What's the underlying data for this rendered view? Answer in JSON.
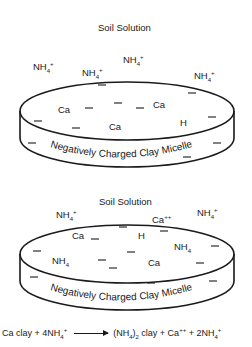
{
  "diagram1": {
    "title": "Soil Solution",
    "solution_ions": [
      {
        "ion": "NH",
        "sub": "4",
        "sup": "+"
      },
      {
        "ion": "NH",
        "sub": "4",
        "sup": "+"
      },
      {
        "ion": "NH",
        "sub": "4",
        "sup": "+"
      },
      {
        "ion": "NH",
        "sub": "4",
        "sup": "+"
      }
    ],
    "micelle_ions": [
      "Ca",
      "Ca",
      "Ca",
      "H"
    ],
    "micelle_label": "Negatively Charged Clay Micelle",
    "charge_symbol": "−"
  },
  "diagram2": {
    "title": "Soil Solution",
    "solution_ions": [
      {
        "ion": "NH",
        "sub": "4",
        "sup": "+"
      },
      {
        "ion": "Ca",
        "sub": "",
        "sup": "++"
      },
      {
        "ion": "NH",
        "sub": "4",
        "sup": "+"
      }
    ],
    "micelle_ions": [
      {
        "ion": "Ca",
        "sub": ""
      },
      {
        "ion": "H",
        "sub": ""
      },
      {
        "ion": "NH",
        "sub": "4"
      },
      {
        "ion": "NH",
        "sub": "4"
      },
      {
        "ion": "Ca",
        "sub": ""
      }
    ],
    "micelle_label": "Negatively Charged Clay Micelle",
    "charge_symbol": "−"
  },
  "equation": {
    "reactant1": "Ca clay + 4NH",
    "reactant1_sub": "4",
    "reactant1_sup": "+",
    "product1_open": "(NH",
    "product1_sub": "4",
    "product1_close": ")",
    "product1_sub2": "2",
    "product1_rest": " clay + Ca",
    "product1_sup": "++",
    "product2": " + 2NH",
    "product2_sub": "4",
    "product2_sup": "+"
  }
}
